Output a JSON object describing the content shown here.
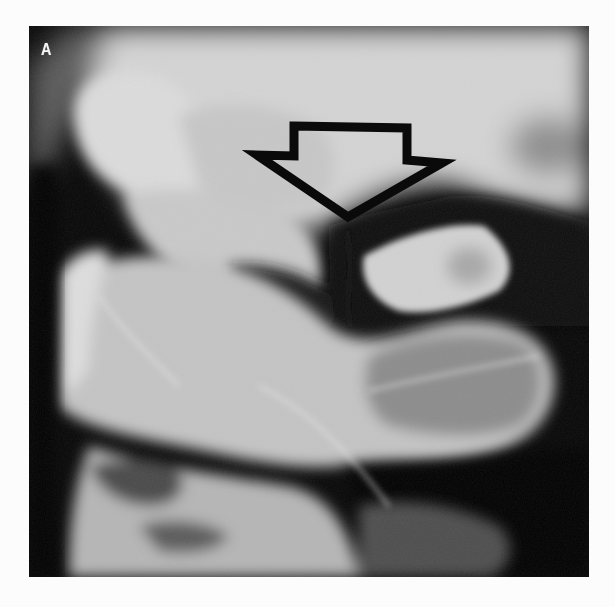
{
  "figure": {
    "panel_label": "A",
    "image_type": "grayscale radiograph",
    "background_color": "#fcfcfc",
    "annotation": {
      "type": "hollow-down-arrow",
      "stroke_color": "#0a0a0a",
      "fill": "transparent"
    }
  }
}
